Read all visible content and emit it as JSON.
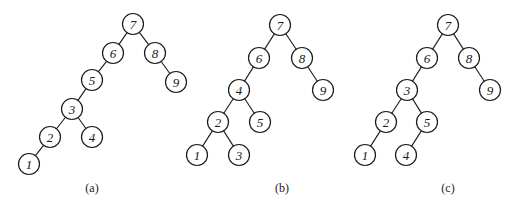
{
  "figure": {
    "node_radius": 10.5,
    "trees": [
      {
        "id": "a",
        "caption": "(a)",
        "caption_pos": [
          92,
          192
        ],
        "nodes": [
          {
            "label": "7",
            "x": 133,
            "y": 24
          },
          {
            "label": "6",
            "x": 113,
            "y": 53
          },
          {
            "label": "8",
            "x": 155,
            "y": 53
          },
          {
            "label": "9",
            "x": 176,
            "y": 82
          },
          {
            "label": "5",
            "x": 92,
            "y": 80
          },
          {
            "label": "3",
            "x": 72,
            "y": 109
          },
          {
            "label": "2",
            "x": 50,
            "y": 137
          },
          {
            "label": "4",
            "x": 92,
            "y": 137
          },
          {
            "label": "1",
            "x": 29,
            "y": 164
          }
        ],
        "edges": [
          [
            "7",
            "6"
          ],
          [
            "7",
            "8"
          ],
          [
            "8",
            "9"
          ],
          [
            "6",
            "5"
          ],
          [
            "5",
            "3"
          ],
          [
            "3",
            "2"
          ],
          [
            "3",
            "4"
          ],
          [
            "2",
            "1"
          ]
        ]
      },
      {
        "id": "b",
        "caption": "(b)",
        "caption_pos": [
          282,
          192
        ],
        "nodes": [
          {
            "label": "7",
            "x": 280,
            "y": 25
          },
          {
            "label": "6",
            "x": 259,
            "y": 58
          },
          {
            "label": "8",
            "x": 302,
            "y": 58
          },
          {
            "label": "9",
            "x": 323,
            "y": 90
          },
          {
            "label": "4",
            "x": 239,
            "y": 90
          },
          {
            "label": "2",
            "x": 218,
            "y": 122
          },
          {
            "label": "5",
            "x": 260,
            "y": 122
          },
          {
            "label": "1",
            "x": 197,
            "y": 155
          },
          {
            "label": "3",
            "x": 239,
            "y": 155
          }
        ],
        "edges": [
          [
            "7",
            "6"
          ],
          [
            "7",
            "8"
          ],
          [
            "8",
            "9"
          ],
          [
            "6",
            "4"
          ],
          [
            "4",
            "2"
          ],
          [
            "4",
            "5"
          ],
          [
            "2",
            "1"
          ],
          [
            "2",
            "3"
          ]
        ]
      },
      {
        "id": "c",
        "caption": "(c)",
        "caption_pos": [
          448,
          192
        ],
        "nodes": [
          {
            "label": "7",
            "x": 448,
            "y": 25
          },
          {
            "label": "6",
            "x": 427,
            "y": 58
          },
          {
            "label": "8",
            "x": 469,
            "y": 58
          },
          {
            "label": "9",
            "x": 490,
            "y": 90
          },
          {
            "label": "3",
            "x": 407,
            "y": 90
          },
          {
            "label": "2",
            "x": 386,
            "y": 122
          },
          {
            "label": "5",
            "x": 427,
            "y": 122
          },
          {
            "label": "1",
            "x": 365,
            "y": 155
          },
          {
            "label": "4",
            "x": 406,
            "y": 155
          }
        ],
        "edges": [
          [
            "7",
            "6"
          ],
          [
            "7",
            "8"
          ],
          [
            "8",
            "9"
          ],
          [
            "6",
            "3"
          ],
          [
            "3",
            "2"
          ],
          [
            "3",
            "5"
          ],
          [
            "2",
            "1"
          ],
          [
            "5",
            "4"
          ]
        ]
      }
    ]
  }
}
